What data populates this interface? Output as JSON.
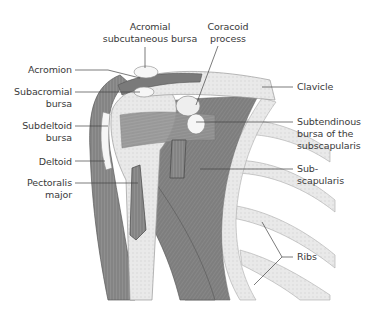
{
  "figure": {
    "colors": {
      "muscle": "#8a8a8a",
      "muscle_dark": "#6c6c6c",
      "bone": "#e6e6e6",
      "bone_edge": "#9a9a9a",
      "bursa": "#f4f4f4",
      "leader": "#444444",
      "text": "#3a3a3a"
    }
  },
  "labels": {
    "acromial_subcutaneous_bursa": [
      "Acromial",
      "subcutaneous bursa"
    ],
    "coracoid_process": [
      "Coracoid",
      "process"
    ],
    "acromion": [
      "Acromion"
    ],
    "subacromial_bursa": [
      "Subacromial",
      "bursa"
    ],
    "subdeltoid_bursa": [
      "Subdeltoid",
      "bursa"
    ],
    "deltoid": [
      "Deltoid"
    ],
    "pectoralis_major": [
      "Pectoralis",
      "major"
    ],
    "clavicle": [
      "Clavicle"
    ],
    "subtendinous_bursa": [
      "Subtendinous",
      "bursa of the",
      "subscapularis"
    ],
    "subscapularis": [
      "Sub-",
      "scapularis"
    ],
    "ribs": [
      "Ribs"
    ]
  }
}
